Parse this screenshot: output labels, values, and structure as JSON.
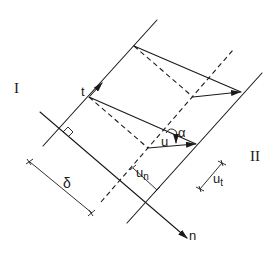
{
  "diagram": {
    "type": "displacement-discontinuity-band",
    "regions": {
      "left": "I",
      "right": "II"
    },
    "labels": {
      "tangent": "t",
      "normal": "n",
      "displacement": "u",
      "angle": "α",
      "thickness": "δ",
      "normal_component": "u",
      "normal_component_sub": "n",
      "tangential_component": "u",
      "tangential_component_sub": "t"
    },
    "colors": {
      "ink": "#1a1a1a",
      "background": "#ffffff"
    }
  }
}
